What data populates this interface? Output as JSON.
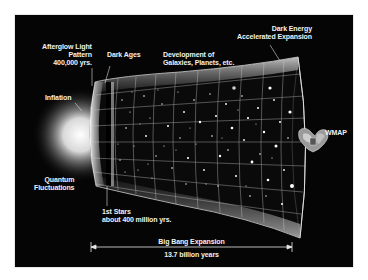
{
  "figure": {
    "background_color": "#ffffff",
    "panel_color": "#050505",
    "text_color": "#f2f2f2"
  },
  "labels": {
    "afterglow": {
      "line1": "Afterglow Light",
      "line2": "Pattern",
      "line3": "400,000 yrs."
    },
    "dark_ages": {
      "line1": "Dark Ages"
    },
    "development": {
      "line1": "Development of",
      "line2": "Galaxies, Planets, etc."
    },
    "dark_energy": {
      "line1": "Dark Energy",
      "line2": "Accelerated Expansion"
    },
    "inflation": {
      "line1": "Inflation"
    },
    "quantum": {
      "line1": "Quantum",
      "line2": "Fluctuations"
    },
    "first_stars": {
      "line1": "1st Stars",
      "line2": "about 400 million yrs."
    },
    "wmap": {
      "line1": "WMAP"
    },
    "timeline": {
      "label": "Big Bang Expansion",
      "duration": "13.7 billion years"
    }
  },
  "icons": {
    "wmap_probe": "satellite-icon",
    "glow": "big-bang-glow"
  }
}
